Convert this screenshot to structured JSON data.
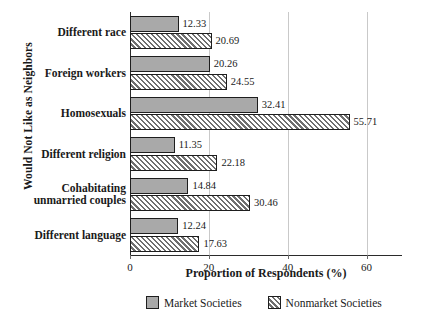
{
  "chart_data": {
    "type": "bar",
    "orientation": "horizontal",
    "title": "",
    "xlabel": "Proportion of Respondents (%)",
    "ylabel": "Would Not Like as Neighbors",
    "categories": [
      "Different race",
      "Foreign workers",
      "Homosexuals",
      "Different religion",
      "Cohabitating unmarried couples",
      "Different language"
    ],
    "category_lines": [
      [
        "Different race"
      ],
      [
        "Foreign workers"
      ],
      [
        "Homosexuals"
      ],
      [
        "Different religion"
      ],
      [
        "Cohabitating",
        "unmarried couples"
      ],
      [
        "Different language"
      ]
    ],
    "series": [
      {
        "name": "Market Societies",
        "pattern": "solid-gray",
        "color": "#a9a9a9",
        "values": [
          12.33,
          20.26,
          32.41,
          11.35,
          14.84,
          12.24
        ],
        "labels": [
          "12.33",
          "20.26",
          "32.41",
          "11.35",
          "14.84",
          "12.24"
        ]
      },
      {
        "name": "Nonmarket Societies",
        "pattern": "diagonal-hatch",
        "color": "#6f6f6f",
        "values": [
          20.69,
          24.55,
          55.71,
          22.18,
          30.46,
          17.63
        ],
        "labels": [
          "20.69",
          "24.55",
          "55.71",
          "22.18",
          "30.46",
          "17.63"
        ]
      }
    ],
    "xlim": [
      0,
      69
    ],
    "xticks": [
      0,
      20,
      40,
      60
    ],
    "xticklabels": [
      "0",
      "20",
      "40",
      "60"
    ],
    "grid": "vertical-at-xticks",
    "legend_position": "bottom-center"
  },
  "legend": {
    "items": [
      {
        "label": "Market Societies",
        "swatch": "market"
      },
      {
        "label": "Nonmarket Societies",
        "swatch": "nonmarket"
      }
    ]
  }
}
